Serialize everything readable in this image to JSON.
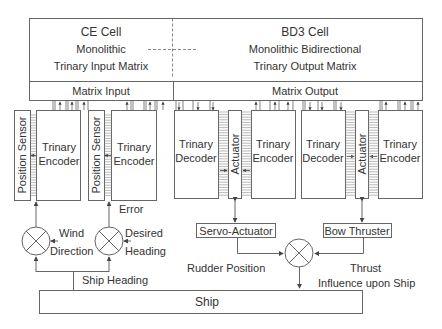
{
  "top": {
    "left_cell": {
      "title": "CE Cell",
      "line2": "Monolithic",
      "line3": "Trinary Input Matrix",
      "bar_label": "Matrix Input"
    },
    "right_cell": {
      "title": "BD3 Cell",
      "line2": "Monolithic Bidirectional",
      "line3": "Trinary Output Matrix",
      "bar_label": "Matrix Output"
    }
  },
  "modules": {
    "sensor1": {
      "sensor": "Position Sensor",
      "encoder_l1": "Trinary",
      "encoder_l2": "Encoder"
    },
    "sensor2": {
      "sensor": "Position Sensor",
      "encoder_l1": "Trinary",
      "encoder_l2": "Encoder"
    },
    "actuator1": {
      "decoder_l1": "Trinary",
      "decoder_l2": "Decoder",
      "actuator": "Actuator",
      "encoder_l1": "Trinary",
      "encoder_l2": "Encoder"
    },
    "actuator2": {
      "decoder_l1": "Trinary",
      "decoder_l2": "Decoder",
      "actuator": "Actuator",
      "encoder_l1": "Trinary",
      "encoder_l2": "Encoder"
    }
  },
  "devices": {
    "servo": "Servo-Actuator",
    "bow": "Bow Thruster",
    "ship": "Ship"
  },
  "signals": {
    "error": "Error",
    "wind_l1": "Wind",
    "wind_l2": "Direction",
    "desired_l1": "Desired",
    "desired_l2": "Heading",
    "ship_heading": "Ship Heading",
    "rudder_position": "Rudder Position",
    "thrust": "Thrust",
    "influence": "Influence upon Ship"
  }
}
